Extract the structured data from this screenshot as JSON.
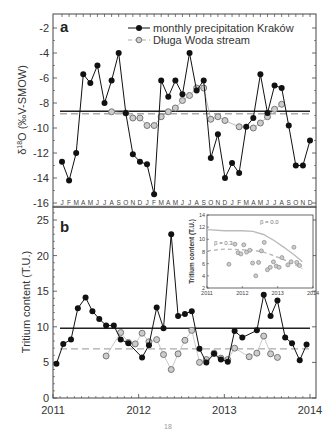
{
  "figure": {
    "bottom_caption": "18"
  },
  "chart_data": [
    {
      "id": "a",
      "type": "line",
      "panel_label": "a",
      "title": "",
      "xlabel": "",
      "ylabel": "δ18O (‰V-SMOW)",
      "ylabel_parts": {
        "delta": "δ",
        "sup": "18",
        "rest": "O (‰V-SMOW)"
      },
      "ylim": [
        -16,
        -1
      ],
      "yticks": [
        -2,
        -4,
        -6,
        -8,
        -10,
        -12,
        -14,
        -16
      ],
      "x_month_labels": [
        "J",
        "F",
        "M",
        "A",
        "M",
        "J",
        "J",
        "A",
        "S",
        "O",
        "N",
        "D",
        "J",
        "F",
        "M",
        "A",
        "M",
        "J",
        "J",
        "A",
        "S",
        "O",
        "N",
        "D",
        "J",
        "F",
        "M",
        "A",
        "M",
        "J",
        "J",
        "A",
        "S",
        "O",
        "N",
        "D"
      ],
      "grid": false,
      "legend_position": "upper right",
      "legend": [
        {
          "name": "monthly precipitation Kraków",
          "style": "solid-black-filled-circle"
        },
        {
          "name": "Długa Woda stream",
          "style": "dashed-grey-open-circle"
        }
      ],
      "series": [
        {
          "name": "monthly precipitation Kraków",
          "x_month_index": [
            0,
            1,
            2,
            3,
            4,
            5,
            6,
            7,
            8,
            9,
            10,
            11,
            12,
            13,
            14,
            15,
            16,
            17,
            18,
            19,
            20,
            21,
            22,
            23,
            24,
            25,
            26,
            27,
            28,
            29,
            30,
            31,
            32,
            33,
            34,
            35
          ],
          "values": [
            -12.7,
            -14.2,
            -12.0,
            -5.7,
            -6.4,
            -5.0,
            -8.0,
            -6.2,
            -4.0,
            -8.8,
            -12.1,
            -12.7,
            -12.9,
            -15.3,
            -6.2,
            -7.5,
            -6.2,
            -7.3,
            -4.0,
            -7.0,
            -6.2,
            -12.4,
            -10.5,
            -14.0,
            -12.8,
            -13.6,
            -9.9,
            -9.2,
            -5.7,
            -8.8,
            -6.6,
            -6.8,
            -9.8,
            -13.0,
            -13.0,
            -11.0
          ]
        },
        {
          "name": "Długa Woda stream",
          "x_month_index": [
            7,
            9,
            10,
            11,
            12,
            13,
            14,
            15,
            16,
            17,
            18,
            19,
            20,
            21,
            22,
            23,
            25,
            27,
            28,
            29,
            30,
            31
          ],
          "values": [
            -8.7,
            -8.8,
            -9.2,
            -9.2,
            -9.8,
            -9.8,
            -9.1,
            -8.7,
            -8.4,
            -7.8,
            -7.4,
            -6.8,
            -6.8,
            -9.3,
            -9.1,
            -9.4,
            -9.9,
            -10.0,
            -9.6,
            -9.1,
            -8.5,
            -8.1
          ]
        }
      ],
      "reference_lines": [
        {
          "name": "mean precipitation",
          "value": -8.65,
          "style": "solid-black"
        },
        {
          "name": "mean stream",
          "value": -8.85,
          "style": "dashed-grey"
        }
      ]
    },
    {
      "id": "b",
      "type": "line",
      "panel_label": "b",
      "title": "",
      "xlabel": "",
      "ylabel": "Tritium content (T.U.)",
      "ylim": [
        0,
        27
      ],
      "yticks": [
        0,
        5,
        10,
        15,
        20,
        25
      ],
      "xlim": [
        2011,
        2014
      ],
      "xticks": [
        "2011",
        "2012",
        "2013",
        "2014"
      ],
      "grid": false,
      "series": [
        {
          "name": "monthly precipitation Kraków",
          "x": [
            2011.04,
            2011.12,
            2011.21,
            2011.29,
            2011.38,
            2011.46,
            2011.54,
            2011.62,
            2011.71,
            2011.79,
            2011.88,
            2012.04,
            2012.12,
            2012.21,
            2012.29,
            2012.38,
            2012.46,
            2012.54,
            2012.62,
            2012.71,
            2012.79,
            2012.88,
            2012.96,
            2013.04,
            2013.12,
            2013.21,
            2013.38,
            2013.46,
            2013.54,
            2013.62,
            2013.71,
            2013.79,
            2013.88,
            2013.96
          ],
          "values": [
            4.8,
            7.6,
            8.2,
            12.6,
            14.1,
            12.2,
            11.1,
            10.2,
            10.2,
            8.2,
            7.7,
            5.7,
            7.4,
            12.7,
            9.8,
            23.0,
            11.5,
            11.8,
            12.2,
            6.9,
            5.0,
            6.2,
            5.4,
            5.1,
            9.4,
            8.5,
            9.5,
            14.5,
            11.5,
            13.7,
            8.5,
            7.7,
            5.3,
            7.5
          ]
        },
        {
          "name": "Długa Woda stream",
          "x": [
            2011.62,
            2011.79,
            2011.88,
            2011.96,
            2012.04,
            2012.12,
            2012.21,
            2012.29,
            2012.38,
            2012.46,
            2012.54,
            2012.62,
            2012.71,
            2012.79,
            2012.88,
            2012.96,
            2013.04,
            2013.12,
            2013.29,
            2013.38,
            2013.46,
            2013.54,
            2013.62
          ],
          "values": [
            5.9,
            9.2,
            7.8,
            7.6,
            9.1,
            7.9,
            8.2,
            6.1,
            4.0,
            6.2,
            8.1,
            9.5,
            5.0,
            5.4,
            6.3,
            5.6,
            5.4,
            7.0,
            5.8,
            6.3,
            8.7,
            6.2,
            5.7
          ]
        }
      ],
      "reference_lines": [
        {
          "name": "mean precipitation",
          "value": 9.8,
          "style": "solid-black"
        },
        {
          "name": "mean stream",
          "value": 6.9,
          "style": "dashed-grey"
        }
      ],
      "inset": {
        "type": "scatter",
        "ylabel": "Tritium content (T.U.)",
        "xlim": [
          2011,
          2014
        ],
        "ylim": [
          2,
          14
        ],
        "xticks": [
          "2011",
          "2012",
          "2013",
          "2014"
        ],
        "yticks": [
          "2",
          "4",
          "6",
          "8",
          "10",
          "12",
          "14"
        ],
        "annotations": [
          {
            "text": "β = 0.0",
            "x": 2012.5,
            "y": 12.5
          },
          {
            "text": "β = 0.3",
            "x": 2011.2,
            "y": 9.0
          }
        ],
        "model_curves": [
          {
            "name": "β = 0.0",
            "style": "solid-lightgrey",
            "x": [
              2011.0,
              2011.5,
              2012.0,
              2012.3,
              2012.6,
              2012.9,
              2013.2,
              2013.5,
              2013.7
            ],
            "y": [
              11.6,
              11.4,
              11.4,
              11.3,
              10.8,
              9.8,
              8.6,
              7.3,
              6.3
            ]
          },
          {
            "name": "β = 0.3",
            "style": "dashed-lightgrey",
            "x": [
              2011.0,
              2011.5,
              2012.0,
              2012.3,
              2012.6,
              2012.9,
              2013.2,
              2013.5,
              2013.7
            ],
            "y": [
              8.1,
              8.4,
              8.3,
              8.2,
              7.9,
              7.3,
              6.6,
              5.8,
              5.2
            ]
          }
        ],
        "points": {
          "x": [
            2011.62,
            2011.79,
            2011.88,
            2011.96,
            2012.04,
            2012.12,
            2012.21,
            2012.29,
            2012.38,
            2012.46,
            2012.54,
            2012.62,
            2012.71,
            2012.79,
            2012.88,
            2012.96,
            2013.04,
            2013.12,
            2013.29,
            2013.38,
            2013.46,
            2013.54,
            2013.62
          ],
          "y": [
            5.9,
            9.2,
            7.8,
            7.6,
            9.1,
            7.9,
            8.2,
            6.1,
            4.0,
            6.2,
            8.1,
            9.5,
            5.0,
            5.4,
            6.3,
            5.6,
            5.4,
            7.0,
            5.8,
            6.3,
            8.7,
            6.2,
            5.7
          ]
        }
      }
    }
  ]
}
